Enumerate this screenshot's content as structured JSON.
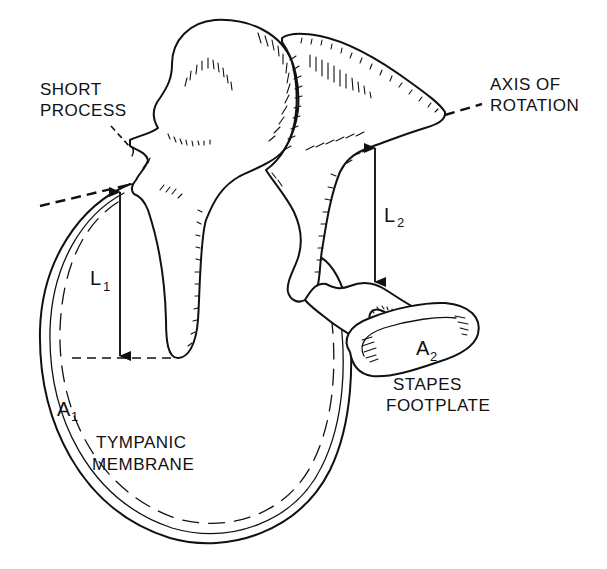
{
  "diagram": {
    "colors": {
      "ink": "#111111",
      "background": "#ffffff"
    },
    "labels": {
      "short_process": [
        "SHORT",
        "PROCESS"
      ],
      "axis_of_rotation": [
        "AXIS OF",
        "ROTATION"
      ],
      "tympanic_membrane": [
        "TYMPANIC",
        "MEMBRANE"
      ],
      "stapes_footplate": [
        "STAPES",
        "FOOTPLATE"
      ]
    },
    "symbols": {
      "l1": {
        "base": "L",
        "sub": "1"
      },
      "l2": {
        "base": "L",
        "sub": "2"
      },
      "a1": {
        "base": "A",
        "sub": "1"
      },
      "a2": {
        "base": "A",
        "sub": "2"
      }
    },
    "structures": [
      "malleus",
      "incus",
      "stapes",
      "tympanic-membrane",
      "axis-of-rotation",
      "lever-arm-l1",
      "lever-arm-l2"
    ]
  }
}
